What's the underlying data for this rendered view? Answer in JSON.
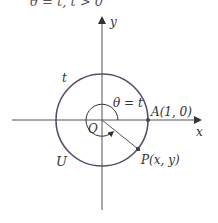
{
  "caption": "θ = t, t > 0",
  "diagram": {
    "type": "unit-circle",
    "colors": {
      "axis": "#555555",
      "circle": "#5a5066",
      "radius": "#555555",
      "point": "#444444",
      "text": "#333333"
    },
    "axes": {
      "x_label": "x",
      "y_label": "y"
    },
    "circle_label": "U",
    "arc_label": "t",
    "angle_label": "θ = t",
    "origin_label": "O",
    "point_a": {
      "label": "A(1, 0)"
    },
    "point_p": {
      "label": "P(x, y)"
    }
  }
}
